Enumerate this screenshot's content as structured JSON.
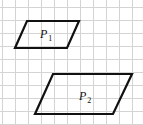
{
  "figure": {
    "width": 143,
    "height": 125,
    "background": "#ffffff",
    "grid": {
      "spacing": 13,
      "offset_x": 2,
      "offset_y": 7,
      "color": "#d4d4d4"
    },
    "shapes": [
      {
        "id": "P1",
        "label": "P",
        "subscript": "1",
        "points": [
          [
            27,
            21
          ],
          [
            79,
            21
          ],
          [
            67,
            48
          ],
          [
            15,
            48
          ]
        ],
        "label_pos": [
          40,
          38
        ],
        "stroke": "#111111"
      },
      {
        "id": "P2",
        "label": "P",
        "subscript": "2",
        "points": [
          [
            53,
            74
          ],
          [
            132,
            74
          ],
          [
            113,
            114
          ],
          [
            35,
            114
          ]
        ],
        "label_pos": [
          79,
          100
        ],
        "stroke": "#111111"
      }
    ]
  }
}
